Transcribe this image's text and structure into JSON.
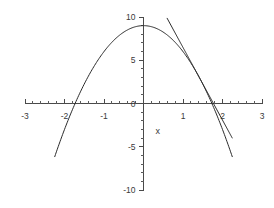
{
  "chart_data": {
    "type": "line",
    "title": "",
    "subtitle": "",
    "xlabel": "x",
    "ylabel": "",
    "xlim": [
      -3,
      3
    ],
    "ylim": [
      -10,
      10
    ],
    "grid": false,
    "legend": null,
    "x_ticks": [
      -3,
      -2,
      -1,
      0,
      1,
      2,
      3
    ],
    "x_tick_labels": [
      "-3",
      "-2",
      "-1",
      "0",
      "1",
      "2",
      "3"
    ],
    "y_ticks": [
      -10,
      -5,
      0,
      5,
      10
    ],
    "y_tick_labels": [
      "-10",
      "-5",
      "0",
      "5",
      "10"
    ],
    "x_minor_step": 0.2,
    "y_minor_step": 1,
    "axis_color": "#4a4a4a",
    "curve_color": "#2b2b2b",
    "background": "#ffffff",
    "series": [
      {
        "name": "parabola",
        "kind": "quadratic",
        "equation": "y = 9 - 3*x^2",
        "a": -3,
        "b": 0,
        "c": 9,
        "vertex": [
          0,
          9
        ],
        "roots": [
          -1.732,
          1.732
        ],
        "x_range": [
          -2.25,
          2.25
        ],
        "points_x": [
          -2.25,
          -2.0,
          -1.75,
          -1.5,
          -1.25,
          -1.0,
          -0.75,
          -0.5,
          -0.25,
          0,
          0.25,
          0.5,
          0.75,
          1.0,
          1.25,
          1.5,
          1.75,
          2.0,
          2.25
        ],
        "points_y": [
          -6.19,
          -3.0,
          -0.19,
          2.25,
          4.31,
          6.0,
          7.31,
          8.25,
          8.81,
          9.0,
          8.81,
          8.25,
          7.31,
          6.0,
          4.31,
          2.25,
          -0.19,
          -3.0,
          -6.19
        ]
      },
      {
        "name": "tangent-line",
        "kind": "linear",
        "equation": "y = -8.4*x + 14.88",
        "slope": -8.4,
        "intercept": 14.88,
        "tangent_point": [
          1.4,
          3.12
        ],
        "x_range": [
          0.58,
          2.25
        ],
        "points_x": [
          0.58,
          1.0,
          1.4,
          1.8,
          2.25
        ],
        "points_y": [
          10.0,
          6.48,
          3.12,
          -0.24,
          -4.02
        ]
      }
    ],
    "annotations": []
  }
}
